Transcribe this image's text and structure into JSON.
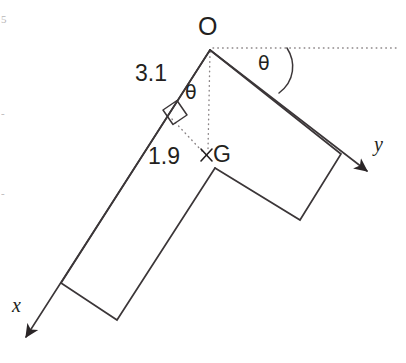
{
  "figure": {
    "stroke_color": "#3b3638",
    "dotted_color": "#8a8486",
    "text_color": "#231f20",
    "background": "#ffffff",
    "points": {
      "origin_label": "O",
      "centroid_label": "G",
      "centroid_marker": "×"
    },
    "axes": {
      "x_label": "x",
      "y_label": "y"
    },
    "angles": {
      "theta_top": "θ",
      "theta_left": "θ"
    },
    "dimensions": {
      "upper": "3.1",
      "lower": "1.9"
    },
    "geometry": {
      "O": [
        210,
        49
      ],
      "G": [
        208,
        155
      ],
      "inner_corner": [
        215,
        168
      ],
      "left_arm_outer_end": [
        61,
        283
      ],
      "left_arm_inner_end": [
        117,
        320
      ],
      "right_arm_outer_end": [
        341,
        154
      ],
      "right_arm_inner_end": [
        300,
        220
      ],
      "x_arrow_tip": [
        21,
        340
      ],
      "y_arrow_tip": [
        373,
        175
      ],
      "dotted_horizontal_end": [
        396,
        48
      ],
      "perp_foot": [
        178,
        124
      ]
    }
  },
  "edge_artifacts": {
    "top": "5",
    "middle": "-",
    "lower": "-"
  }
}
